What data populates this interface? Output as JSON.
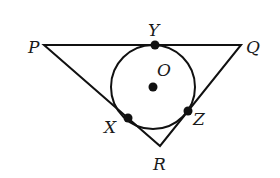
{
  "diagram": {
    "vertices": {
      "P": {
        "label": "P",
        "x": 44,
        "y": 45
      },
      "Q": {
        "label": "Q",
        "x": 241,
        "y": 45
      },
      "R": {
        "label": "R",
        "x": 160,
        "y": 146
      }
    },
    "circle": {
      "center_label": "O",
      "cx": 153,
      "cy": 87,
      "r": 42
    },
    "points": {
      "Y": {
        "label": "Y",
        "x": 155,
        "y": 45
      },
      "X": {
        "label": "X",
        "x": 128,
        "y": 118
      },
      "Z": {
        "label": "Z",
        "x": 188,
        "y": 111
      },
      "O": {
        "label": "O",
        "x": 153,
        "y": 87
      }
    },
    "stroke_color": "#111111"
  }
}
